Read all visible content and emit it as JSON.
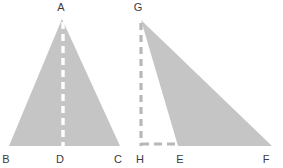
{
  "figure": {
    "background_color": "#ffffff",
    "fill_color": "#c5c5c5",
    "dash_white_color": "#ffffff",
    "dash_gray_color": "#b8b8b8",
    "label_color": "#3b3b3b",
    "label_font_size": "11px"
  },
  "left_figure": {
    "name": "triangle-abc",
    "shaded": true,
    "vertices": [
      {
        "id": "A",
        "label": "A",
        "x": 62,
        "y": 19,
        "label_x": 61,
        "label_y": 11
      },
      {
        "id": "B",
        "label": "B",
        "x": 9,
        "y": 146,
        "label_x": 6,
        "label_y": 163
      },
      {
        "id": "C",
        "label": "C",
        "x": 120,
        "y": 146,
        "label_x": 118,
        "label_y": 163
      }
    ],
    "polygon_points": "62,19 120,146 9,146",
    "altitude": {
      "name": "altitude-a-d",
      "style": "dashed",
      "color": "#ffffff",
      "from": "A",
      "to": "D",
      "x1": 63,
      "y1": 22,
      "x2": 63,
      "y2": 146
    },
    "foot": {
      "id": "D",
      "label": "D",
      "x": 63,
      "y": 146,
      "label_x": 60,
      "label_y": 163
    }
  },
  "right_figure": {
    "name": "triangle-gef",
    "shaded": true,
    "vertices": [
      {
        "id": "G",
        "label": "G",
        "x": 141,
        "y": 20,
        "label_x": 138,
        "label_y": 11
      },
      {
        "id": "E",
        "label": "E",
        "x": 178,
        "y": 146,
        "label_x": 180,
        "label_y": 163
      },
      {
        "id": "F",
        "label": "F",
        "x": 272,
        "y": 146,
        "label_x": 266,
        "label_y": 163
      }
    ],
    "polygon_points": "141,20 272,146 178,146",
    "altitude": {
      "name": "altitude-g-h",
      "style": "dashed",
      "color": "#b8b8b8",
      "from": "G",
      "to": "H",
      "x1": 141,
      "y1": 23,
      "x2": 141,
      "y2": 146
    },
    "base_extension": {
      "name": "segment-h-e",
      "style": "dashed",
      "color": "#b8b8b8",
      "from": "H",
      "to": "E",
      "x1": 141,
      "y1": 144,
      "x2": 178,
      "y2": 144
    },
    "foot": {
      "id": "H",
      "label": "H",
      "x": 141,
      "y": 146,
      "label_x": 140,
      "label_y": 163
    }
  }
}
